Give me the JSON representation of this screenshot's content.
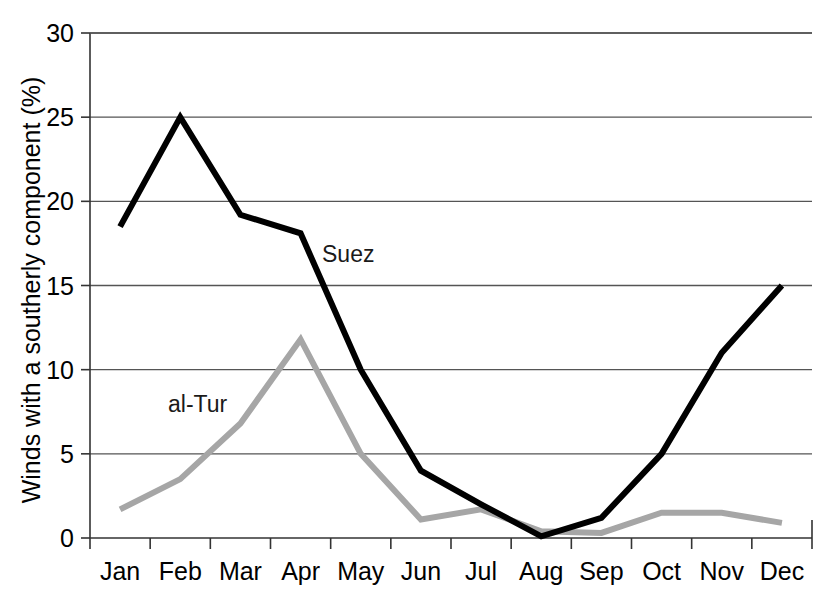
{
  "chart_data": {
    "type": "line",
    "title": "",
    "subtitle": "",
    "xlabel": "",
    "ylabel": "Winds with a southerly component (%)",
    "categories": [
      "Jan",
      "Feb",
      "Mar",
      "Apr",
      "May",
      "Jun",
      "Jul",
      "Aug",
      "Sep",
      "Oct",
      "Nov",
      "Dec"
    ],
    "ylim": [
      0,
      30
    ],
    "yticks": [
      0,
      5,
      10,
      15,
      20,
      25,
      30
    ],
    "ytick_labels": [
      "0",
      "5",
      "10",
      "15",
      "20",
      "25",
      "30"
    ],
    "grid": "horizontal",
    "legend_position": "inline-annotations",
    "series": [
      {
        "name": "Suez",
        "color": "#000000",
        "values": [
          18.5,
          25.0,
          19.2,
          18.1,
          10.0,
          4.0,
          2.0,
          0.1,
          1.2,
          5.0,
          11.0,
          15.0
        ]
      },
      {
        "name": "al-Tur",
        "color": "#a6a6a6",
        "values": [
          1.7,
          3.5,
          6.8,
          11.8,
          5.0,
          1.1,
          1.7,
          0.4,
          0.3,
          1.5,
          1.5,
          0.9
        ]
      }
    ],
    "annotations": [
      {
        "text": "Suez",
        "series": "Suez",
        "x_px": 322,
        "y_px": 262
      },
      {
        "text": "al-Tur",
        "series": "al-Tur",
        "x_px": 168,
        "y_px": 412
      }
    ]
  },
  "axes": {
    "y_axis_title": "Winds with a southerly component (%)",
    "y_tick_labels": [
      "30",
      "25",
      "20",
      "15",
      "10",
      "5",
      "0"
    ],
    "x_tick_labels": [
      "Jan",
      "Feb",
      "Mar",
      "Apr",
      "May",
      "Jun",
      "Jul",
      "Aug",
      "Sep",
      "Oct",
      "Nov",
      "Dec"
    ]
  },
  "colors": {
    "suez_line": "#000000",
    "altur_line": "#a6a6a6",
    "gridline": "#555555",
    "axis": "#333333",
    "background": "#ffffff"
  }
}
